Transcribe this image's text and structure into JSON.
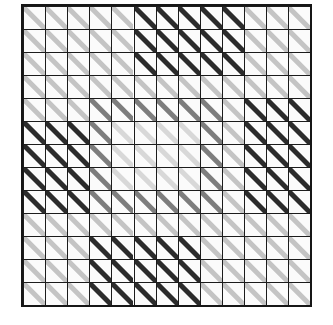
{
  "figure": {
    "type": "grid-of-oriented-line-segments",
    "background_color": "#ffffff",
    "cell_fill_color": "#fbfbfb",
    "grid_line_color": "#1c1c1c",
    "border_color": "#161616",
    "segment_orientation_degrees": 45,
    "segment_orientation_label": "top-left to bottom-right diagonal"
  },
  "grid": {
    "rows": 13,
    "cols": 13,
    "origin_x": 23,
    "origin_y": 6,
    "cell_width": 22.1,
    "cell_height": 23.0,
    "line_width": 1,
    "border_width": 2
  },
  "segment_style": {
    "thickness_dark": 5.0,
    "thickness_light": 5.0,
    "length_ratio_dark": 1.32,
    "length_ratio_light": 1.18,
    "color_dark": "#2b2b2b",
    "color_mid": "#7d7d7d",
    "color_light": "#c4c4c4",
    "color_faint": "#d8d8d8"
  },
  "legend": {
    "levels": [
      {
        "name": "dark",
        "color": "#2b2b2b",
        "label": "high contrast"
      },
      {
        "name": "mid",
        "color": "#7d7d7d",
        "label": "medium contrast"
      },
      {
        "name": "light",
        "color": "#c4c4c4",
        "label": "low contrast"
      },
      {
        "name": "faint",
        "color": "#d8d8d8",
        "label": "very low contrast"
      }
    ]
  },
  "chart_data": {
    "type": "heatmap",
    "xlabel": "column",
    "ylabel": "row",
    "categories_x": [
      1,
      2,
      3,
      4,
      5,
      6,
      7,
      8,
      9,
      10,
      11,
      12,
      13
    ],
    "categories_y": [
      1,
      2,
      3,
      4,
      5,
      6,
      7,
      8,
      9,
      10,
      11,
      12,
      13
    ],
    "value_scale": [
      "faint",
      "light",
      "mid",
      "dark"
    ],
    "grid": true,
    "legend_position": "none",
    "cells": [
      [
        "light",
        "light",
        "light",
        "light",
        "light",
        "dark",
        "dark",
        "dark",
        "dark",
        "dark",
        "light",
        "light",
        "light"
      ],
      [
        "light",
        "light",
        "light",
        "light",
        "light",
        "dark",
        "dark",
        "dark",
        "dark",
        "dark",
        "light",
        "light",
        "light"
      ],
      [
        "light",
        "light",
        "light",
        "light",
        "light",
        "dark",
        "dark",
        "dark",
        "dark",
        "dark",
        "light",
        "light",
        "light"
      ],
      [
        "light",
        "light",
        "light",
        "light",
        "light",
        "light",
        "light",
        "light",
        "light",
        "light",
        "light",
        "light",
        "light"
      ],
      [
        "light",
        "light",
        "light",
        "mid",
        "mid",
        "mid",
        "mid",
        "mid",
        "mid",
        "light",
        "dark",
        "dark",
        "dark"
      ],
      [
        "dark",
        "dark",
        "dark",
        "mid",
        "faint",
        "faint",
        "faint",
        "faint",
        "mid",
        "light",
        "dark",
        "dark",
        "dark"
      ],
      [
        "dark",
        "dark",
        "dark",
        "mid",
        "faint",
        "faint",
        "faint",
        "faint",
        "mid",
        "light",
        "dark",
        "dark",
        "dark"
      ],
      [
        "dark",
        "dark",
        "dark",
        "mid",
        "faint",
        "faint",
        "faint",
        "faint",
        "mid",
        "light",
        "dark",
        "dark",
        "dark"
      ],
      [
        "dark",
        "dark",
        "dark",
        "mid",
        "mid",
        "mid",
        "mid",
        "mid",
        "mid",
        "light",
        "dark",
        "dark",
        "dark"
      ],
      [
        "light",
        "light",
        "light",
        "light",
        "light",
        "light",
        "light",
        "light",
        "light",
        "light",
        "light",
        "light",
        "light"
      ],
      [
        "light",
        "light",
        "light",
        "dark",
        "dark",
        "dark",
        "dark",
        "dark",
        "light",
        "light",
        "light",
        "light",
        "light"
      ],
      [
        "light",
        "light",
        "light",
        "dark",
        "dark",
        "dark",
        "dark",
        "dark",
        "light",
        "light",
        "light",
        "light",
        "light"
      ],
      [
        "light",
        "light",
        "light",
        "dark",
        "dark",
        "dark",
        "dark",
        "dark",
        "light",
        "light",
        "light",
        "light",
        "light"
      ]
    ]
  }
}
